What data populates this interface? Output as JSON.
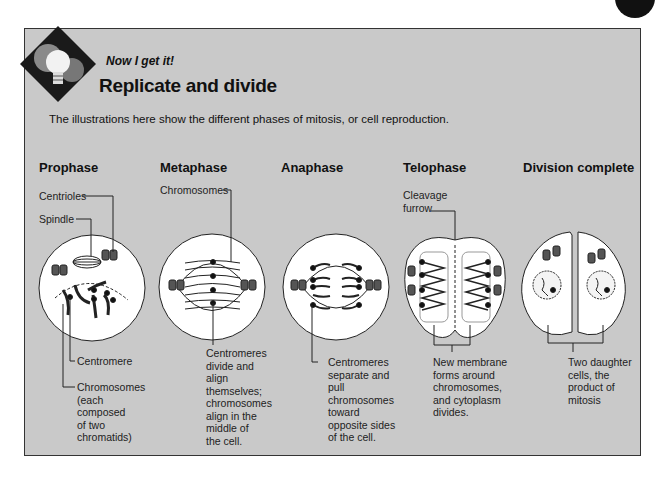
{
  "header": {
    "kicker": "Now I get it!",
    "title": "Replicate and divide",
    "intro": "The illustrations here show the different phases of mitosis, or cell reproduction.",
    "badge_icon": "lightbulb-gears-icon"
  },
  "phases": [
    {
      "title": "Prophase",
      "labels": {
        "centrioles": "Centrioles",
        "spindle": "Spindle",
        "centromere": "Centromere",
        "chromosomes": [
          "Chromosomes",
          "(each",
          "composed",
          "of two",
          "chromatids)"
        ]
      }
    },
    {
      "title": "Metaphase",
      "labels": {
        "chromosomes": "Chromosomes",
        "caption": [
          "Centromeres",
          "divide and",
          "align",
          "themselves;",
          "chromosomes",
          "align in the",
          "middle of",
          "the cell."
        ]
      }
    },
    {
      "title": "Anaphase",
      "labels": {
        "caption": [
          "Centromeres",
          "separate and",
          "pull",
          "chromosomes",
          "toward",
          "opposite sides",
          "of the cell."
        ]
      }
    },
    {
      "title": "Telophase",
      "labels": {
        "cleavage": [
          "Cleavage",
          "furrow"
        ],
        "caption": [
          "New membrane",
          "forms around",
          "chromosomes,",
          "and cytoplasm",
          "divides."
        ]
      }
    },
    {
      "title": "Division complete",
      "labels": {
        "caption": [
          "Two daughter",
          "cells, the",
          "product of",
          "mitosis"
        ]
      }
    }
  ],
  "colors": {
    "panel_bg": "#c9c9c9",
    "cell_fill": "#ffffff",
    "ink": "#111111"
  }
}
